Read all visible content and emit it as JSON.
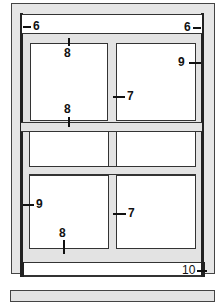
{
  "diagram": {
    "callouts": [
      {
        "id": "head-left",
        "label": "6"
      },
      {
        "id": "head-right",
        "label": "6"
      },
      {
        "id": "upper-sash-top-rail",
        "label": "8"
      },
      {
        "id": "upper-sash-stile-right",
        "label": "9"
      },
      {
        "id": "upper-mullion",
        "label": "7"
      },
      {
        "id": "meeting-rail",
        "label": "8"
      },
      {
        "id": "lower-sash-stile-left",
        "label": "9"
      },
      {
        "id": "lower-mullion",
        "label": "7"
      },
      {
        "id": "lower-sash-bottom-rail",
        "label": "8"
      },
      {
        "id": "sill",
        "label": "10"
      }
    ],
    "colors": {
      "frame": "#e6e6e6",
      "outline": "#333333",
      "glass": "#ffffff"
    }
  }
}
